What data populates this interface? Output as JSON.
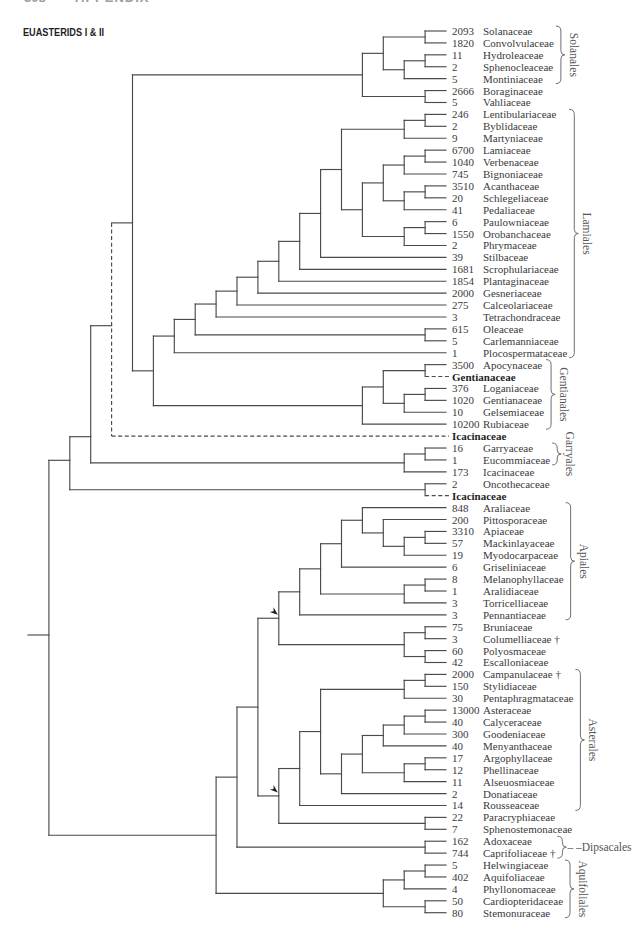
{
  "page_header": {
    "page_number": "308",
    "section": "APPENDIX"
  },
  "figure": {
    "title": "EUASTERIDS I & II"
  },
  "leaves": [
    {
      "count": 2093,
      "name": "Solanaceae"
    },
    {
      "count": 1820,
      "name": "Convolvulaceae"
    },
    {
      "count": 11,
      "name": "Hydroleaceae"
    },
    {
      "count": 2,
      "name": "Sphenocleaceae"
    },
    {
      "count": 5,
      "name": "Montiniaceae"
    },
    {
      "count": 2666,
      "name": "Boraginaceae"
    },
    {
      "count": 5,
      "name": "Vahliaceae"
    },
    {
      "count": 246,
      "name": "Lentibulariaceae"
    },
    {
      "count": 2,
      "name": "Byblidaceae"
    },
    {
      "count": 9,
      "name": "Martyniaceae"
    },
    {
      "count": 6700,
      "name": "Lamiaceae"
    },
    {
      "count": 1040,
      "name": "Verbenaceae"
    },
    {
      "count": 745,
      "name": "Bignoniaceae"
    },
    {
      "count": 3510,
      "name": "Acanthaceae"
    },
    {
      "count": 20,
      "name": "Schlegeliaceae"
    },
    {
      "count": 41,
      "name": "Pedaliaceae"
    },
    {
      "count": 6,
      "name": "Paulowniaceae"
    },
    {
      "count": 1550,
      "name": "Orobanchaceae"
    },
    {
      "count": 2,
      "name": "Phrymaceae"
    },
    {
      "count": 39,
      "name": "Stilbaceae"
    },
    {
      "count": 1681,
      "name": "Scrophulariaceae"
    },
    {
      "count": 1854,
      "name": "Plantaginaceae"
    },
    {
      "count": 2000,
      "name": "Gesneriaceae"
    },
    {
      "count": 275,
      "name": "Calceolariaceae"
    },
    {
      "count": 3,
      "name": "Tetrachondraceae"
    },
    {
      "count": 615,
      "name": "Oleaceae"
    },
    {
      "count": 5,
      "name": "Carlemanniaceae"
    },
    {
      "count": 1,
      "name": "Plocospermataceae"
    },
    {
      "count": 3500,
      "name": "Apocynaceae"
    },
    {
      "count": null,
      "name": "Gentianaceae",
      "uncertain_placement": true
    },
    {
      "count": 376,
      "name": "Loganiaceae"
    },
    {
      "count": 1020,
      "name": "Gentianaceae"
    },
    {
      "count": 10,
      "name": "Gelsemiaceae"
    },
    {
      "count": 10200,
      "name": "Rubiaceae"
    },
    {
      "count": null,
      "name": "Icacinaceae",
      "uncertain_placement": true
    },
    {
      "count": 16,
      "name": "Garryaceae"
    },
    {
      "count": 1,
      "name": "Eucommiaceae"
    },
    {
      "count": 173,
      "name": "Icacinaceae"
    },
    {
      "count": 2,
      "name": "Oncothecaceae"
    },
    {
      "count": null,
      "name": "Icacinaceae",
      "uncertain_placement": true
    },
    {
      "count": 848,
      "name": "Araliaceae"
    },
    {
      "count": 200,
      "name": "Pittosporaceae"
    },
    {
      "count": 3310,
      "name": "Apiaceae"
    },
    {
      "count": 57,
      "name": "Mackinlayaceae"
    },
    {
      "count": 19,
      "name": "Myodocarpaceae"
    },
    {
      "count": 6,
      "name": "Griseliniaceae"
    },
    {
      "count": 8,
      "name": "Melanophyllaceae"
    },
    {
      "count": 1,
      "name": "Aralidiaceae"
    },
    {
      "count": 3,
      "name": "Torricelliaceae"
    },
    {
      "count": 3,
      "name": "Pennantiaceae"
    },
    {
      "count": 75,
      "name": "Bruniaceae"
    },
    {
      "count": 3,
      "name": "Columelliaceae †"
    },
    {
      "count": 60,
      "name": "Polyosmaceae"
    },
    {
      "count": 42,
      "name": "Escalloniaceae"
    },
    {
      "count": 2000,
      "name": "Campanulaceae †"
    },
    {
      "count": 150,
      "name": "Stylidiaceae"
    },
    {
      "count": 30,
      "name": "Pentaphragmataceae"
    },
    {
      "count": 13000,
      "name": "Asteraceae"
    },
    {
      "count": 40,
      "name": "Calyceraceae"
    },
    {
      "count": 300,
      "name": "Goodeniaceae"
    },
    {
      "count": 40,
      "name": "Menyanthaceae"
    },
    {
      "count": 17,
      "name": "Argophyllaceae"
    },
    {
      "count": 12,
      "name": "Phellinaceae"
    },
    {
      "count": 11,
      "name": "Alseuosmiaceae"
    },
    {
      "count": 2,
      "name": "Donatiaceae"
    },
    {
      "count": 14,
      "name": "Rousseaceae"
    },
    {
      "count": 22,
      "name": "Paracryphiaceae"
    },
    {
      "count": 7,
      "name": "Sphenostemonaceae"
    },
    {
      "count": 162,
      "name": "Adoxaceae"
    },
    {
      "count": 744,
      "name": "Caprifoliaceae †"
    },
    {
      "count": 5,
      "name": "Helwingiaceae"
    },
    {
      "count": 402,
      "name": "Aquifoliaceae"
    },
    {
      "count": 4,
      "name": "Phyllonomaceae"
    },
    {
      "count": 50,
      "name": "Cardiopteridaceae"
    },
    {
      "count": 80,
      "name": "Stemonuraceae"
    }
  ],
  "tree": [
    [
      [
        {
          "uncertain_placement": true,
          "children": [
            [
              [
                [
                  [
                    0,
                    1
                  ],
                  [
                    [
                      2,
                      3
                    ],
                    4
                  ]
                ],
                [
                  5,
                  6
                ]
              ],
              [
                [
                  [
                    [
                      [
                        [
                          [
                            [
                              [
                                [
                                  [
                                    [
                                      7,
                                      8
                                    ],
                                    9
                                  ],
                                  [
                                    [
                                      [
                                        [
                                          10,
                                          11
                                        ],
                                        12
                                      ],
                                      [
                                        [
                                          13,
                                          14
                                        ],
                                        15
                                      ]
                                    ],
                                    [
                                      [
                                        16,
                                        17
                                      ],
                                      18
                                    ]
                                  ]
                                ],
                                19
                              ],
                              20
                            ],
                            21
                          ],
                          22
                        ],
                        23
                      ],
                      24
                    ],
                    [
                      25,
                      26
                    ]
                  ],
                  27
                ],
                [
                  [
                    [
                      28,
                      29
                    ],
                    [
                      [
                        30,
                        31
                      ],
                      32
                    ]
                  ],
                  33
                ]
              ]
            ],
            34
          ]
        },
        [
          [
            35,
            36
          ],
          37
        ]
      ],
      [
        38,
        39
      ]
    ],
    [
      [
        [
          {
            "arrowhead": true,
            "children": [
              [
                [
                  [
                    [
                      40,
                      [
                        41,
                        [
                          [
                            42,
                            43
                          ],
                          44
                        ]
                      ]
                    ],
                    45
                  ],
                  [
                    [
                      46,
                      47
                    ],
                    48
                  ]
                ],
                49
              ],
              [
                [
                  50,
                  51
                ],
                [
                  52,
                  53
                ]
              ]
            ]
          },
          {
            "arrowhead": true,
            "children": [
              [
                [
                  [
                    [
                      54,
                      55
                    ],
                    56
                  ],
                  [
                    [
                      [
                        [
                          [
                            57,
                            58
                          ],
                          59
                        ],
                        60
                      ],
                      [
                        [
                          61,
                          62
                        ],
                        63
                      ]
                    ],
                    64
                  ]
                ],
                65
              ],
              [
                66,
                67
              ]
            ]
          }
        ],
        [
          68,
          69
        ]
      ],
      [
        [
          [
            70,
            71
          ],
          72
        ],
        [
          73,
          74
        ]
      ]
    ]
  ],
  "orders": [
    {
      "label": "Solanales",
      "first_row": 0,
      "last_row": 4,
      "orientation": "vertical"
    },
    {
      "label": "Lamiales",
      "first_row": 7,
      "last_row": 27,
      "orientation": "vertical"
    },
    {
      "label": "Gentianales",
      "first_row": 28,
      "last_row": 33,
      "orientation": "vertical"
    },
    {
      "label": "Garryales",
      "first_row": 35,
      "last_row": 36,
      "orientation": "vertical"
    },
    {
      "label": "Apiales",
      "first_row": 40,
      "last_row": 49,
      "orientation": "vertical"
    },
    {
      "label": "Asterales",
      "first_row": 54,
      "last_row": 65,
      "orientation": "vertical"
    },
    {
      "label": "Dipsacales",
      "label_prefix": "– –",
      "first_row": 68,
      "last_row": 69,
      "orientation": "horizontal"
    },
    {
      "label": "Aquifoliales",
      "first_row": 70,
      "last_row": 74,
      "orientation": "vertical"
    }
  ]
}
